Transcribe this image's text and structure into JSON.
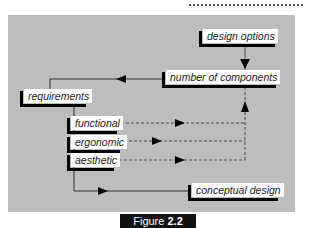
{
  "diagram": {
    "background_color": "#bdbdbd",
    "nodes": [
      {
        "id": "design_options",
        "label": "design options"
      },
      {
        "id": "number_of_components",
        "label": "number of components"
      },
      {
        "id": "requirements",
        "label": "requirements"
      },
      {
        "id": "functional",
        "label": "functional"
      },
      {
        "id": "ergonomic",
        "label": "ergonomic"
      },
      {
        "id": "aesthetic",
        "label": "aesthetic"
      },
      {
        "id": "conceptual_design",
        "label": "conceptual design"
      }
    ],
    "edges": [
      {
        "from": "design_options",
        "to": "number_of_components",
        "style": "solid"
      },
      {
        "from": "number_of_components",
        "to": "requirements",
        "style": "solid"
      },
      {
        "from": "requirements",
        "to": "functional",
        "style": "solid"
      },
      {
        "from": "requirements",
        "to": "ergonomic",
        "style": "solid"
      },
      {
        "from": "requirements",
        "to": "aesthetic",
        "style": "solid"
      },
      {
        "from": "functional",
        "to": "number_of_components",
        "style": "dashed"
      },
      {
        "from": "ergonomic",
        "to": "number_of_components",
        "style": "dashed"
      },
      {
        "from": "aesthetic",
        "to": "number_of_components",
        "style": "dashed"
      },
      {
        "from": "requirements",
        "to": "conceptual_design",
        "style": "solid"
      }
    ]
  },
  "figure": {
    "prefix": "Figure ",
    "number": "2.2"
  }
}
